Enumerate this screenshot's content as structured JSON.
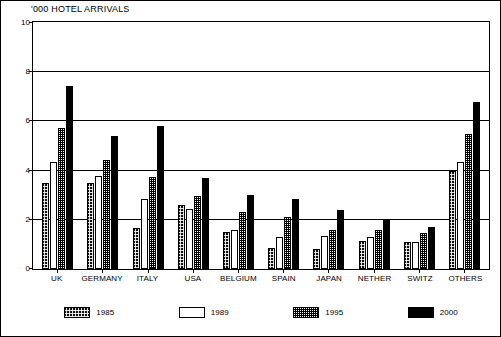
{
  "chart_data": {
    "type": "bar",
    "title": "'000 HOTEL ARRIVALS",
    "xlabel": "",
    "ylabel": "",
    "ylim": [
      0,
      10
    ],
    "yticks": [
      0,
      2,
      4,
      6,
      8,
      10
    ],
    "ytick_labels": [
      "0",
      "2",
      "4",
      "6",
      "8",
      "10"
    ],
    "grid": true,
    "legend_position": "bottom",
    "categories": [
      "UK",
      "GERMANY",
      "ITALY",
      "USA",
      "BELGIUM",
      "SPAIN",
      "JAPAN",
      "NETHER",
      "SWITZ",
      "OTHERS"
    ],
    "series": [
      {
        "name": "1985",
        "fill": "dark-speckled",
        "color": "#101010",
        "values": [
          3.5,
          3.5,
          1.65,
          2.6,
          1.5,
          0.85,
          0.8,
          1.15,
          1.1,
          4.0
        ]
      },
      {
        "name": "1989",
        "fill": "white",
        "color": "#ffffff",
        "values": [
          4.35,
          3.8,
          2.85,
          2.45,
          1.6,
          1.3,
          1.35,
          1.3,
          1.1,
          4.35
        ]
      },
      {
        "name": "1995",
        "fill": "light-dotted",
        "color": "#808080",
        "values": [
          5.75,
          4.45,
          3.75,
          2.95,
          2.3,
          2.1,
          1.6,
          1.6,
          1.45,
          5.5
        ]
      },
      {
        "name": "2000",
        "fill": "solid-black",
        "color": "#000000",
        "values": [
          7.45,
          5.4,
          5.8,
          3.7,
          3.0,
          2.85,
          2.4,
          2.05,
          1.7,
          6.8
        ]
      }
    ]
  },
  "legend": {
    "items": [
      {
        "label": "1985"
      },
      {
        "label": "1989"
      },
      {
        "label": "1995"
      },
      {
        "label": "2000"
      }
    ]
  }
}
